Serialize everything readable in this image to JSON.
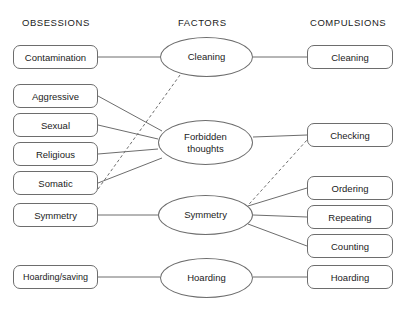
{
  "diagram": {
    "title_present": false,
    "background_color": "#ffffff",
    "stroke_color": "#6d6d6d",
    "text_color": "#1b1b1b",
    "columns": [
      {
        "id": "obsessions",
        "label": "OBSESSIONS"
      },
      {
        "id": "factors",
        "label": "FACTORS"
      },
      {
        "id": "compulsions",
        "label": "COMPULSIONS"
      }
    ],
    "obsessions": [
      {
        "id": "contamination",
        "label": "Contamination",
        "x": 13,
        "y": 45,
        "w": 85,
        "h": 24
      },
      {
        "id": "aggressive",
        "label": "Aggressive",
        "x": 13,
        "y": 84,
        "w": 85,
        "h": 24
      },
      {
        "id": "sexual",
        "label": "Sexual",
        "x": 13,
        "y": 113,
        "w": 85,
        "h": 24
      },
      {
        "id": "religious",
        "label": "Religious",
        "x": 13,
        "y": 142,
        "w": 85,
        "h": 24
      },
      {
        "id": "somatic",
        "label": "Somatic",
        "x": 13,
        "y": 171,
        "w": 85,
        "h": 24
      },
      {
        "id": "symmetry-obs",
        "label": "Symmetry",
        "x": 13,
        "y": 203,
        "w": 85,
        "h": 24
      },
      {
        "id": "hoarding-saving",
        "label": "Hoarding/saving",
        "x": 13,
        "y": 265,
        "w": 85,
        "h": 24
      }
    ],
    "factors": [
      {
        "id": "cleaning-factor",
        "label": "Cleaning",
        "lines": [
          "Cleaning"
        ],
        "x": 160,
        "y": 37,
        "w": 93,
        "h": 40
      },
      {
        "id": "forbidden-thoughts-factor",
        "label": "Forbidden thoughts",
        "lines": [
          "Forbidden",
          "thoughts"
        ],
        "x": 158,
        "y": 120,
        "w": 95,
        "h": 45
      },
      {
        "id": "symmetry-factor",
        "label": "Symmetry",
        "lines": [
          "Symmetry"
        ],
        "x": 158,
        "y": 195,
        "w": 95,
        "h": 40
      },
      {
        "id": "hoarding-factor",
        "label": "Hoarding",
        "lines": [
          "Hoarding"
        ],
        "x": 160,
        "y": 258,
        "w": 93,
        "h": 40
      }
    ],
    "compulsions": [
      {
        "id": "cleaning-comp",
        "label": "Cleaning",
        "x": 307,
        "y": 45,
        "w": 86,
        "h": 24
      },
      {
        "id": "checking",
        "label": "Checking",
        "x": 307,
        "y": 123,
        "w": 86,
        "h": 24
      },
      {
        "id": "ordering",
        "label": "Ordering",
        "x": 307,
        "y": 176,
        "w": 86,
        "h": 24
      },
      {
        "id": "repeating",
        "label": "Repeating",
        "x": 307,
        "y": 205,
        "w": 86,
        "h": 24
      },
      {
        "id": "counting",
        "label": "Counting",
        "x": 307,
        "y": 234,
        "w": 86,
        "h": 24
      },
      {
        "id": "hoarding-comp",
        "label": "Hoarding",
        "x": 307,
        "y": 265,
        "w": 86,
        "h": 24
      }
    ],
    "edges": [
      {
        "from": "contamination",
        "to": "cleaning-factor",
        "style": "solid",
        "x1": 98,
        "y1": 57,
        "x2": 160,
        "y2": 57
      },
      {
        "from": "cleaning-factor",
        "to": "cleaning-comp",
        "style": "solid",
        "x1": 253,
        "y1": 57,
        "x2": 307,
        "y2": 57
      },
      {
        "from": "somatic",
        "to": "cleaning-factor",
        "style": "dashed",
        "x1": 98,
        "y1": 189,
        "x2": 180,
        "y2": 75
      },
      {
        "from": "aggressive",
        "to": "forbidden-thoughts-factor",
        "style": "solid",
        "x1": 98,
        "y1": 96,
        "x2": 162,
        "y2": 131
      },
      {
        "from": "sexual",
        "to": "forbidden-thoughts-factor",
        "style": "solid",
        "x1": 98,
        "y1": 125,
        "x2": 158,
        "y2": 139
      },
      {
        "from": "religious",
        "to": "forbidden-thoughts-factor",
        "style": "solid",
        "x1": 98,
        "y1": 154,
        "x2": 158,
        "y2": 149
      },
      {
        "from": "somatic",
        "to": "forbidden-thoughts-factor",
        "style": "solid",
        "x1": 98,
        "y1": 183,
        "x2": 162,
        "y2": 158
      },
      {
        "from": "forbidden-thoughts-factor",
        "to": "checking",
        "style": "solid",
        "x1": 253,
        "y1": 137,
        "x2": 307,
        "y2": 135
      },
      {
        "from": "symmetry-factor",
        "to": "checking",
        "style": "dashed",
        "x1": 242,
        "y1": 212,
        "x2": 307,
        "y2": 140
      },
      {
        "from": "symmetry-obs",
        "to": "symmetry-factor",
        "style": "solid",
        "x1": 98,
        "y1": 215,
        "x2": 158,
        "y2": 215
      },
      {
        "from": "symmetry-factor",
        "to": "ordering",
        "style": "solid",
        "x1": 248,
        "y1": 206,
        "x2": 307,
        "y2": 188
      },
      {
        "from": "symmetry-factor",
        "to": "repeating",
        "style": "solid",
        "x1": 253,
        "y1": 215,
        "x2": 307,
        "y2": 217
      },
      {
        "from": "symmetry-factor",
        "to": "counting",
        "style": "solid",
        "x1": 248,
        "y1": 224,
        "x2": 307,
        "y2": 246
      },
      {
        "from": "hoarding-saving",
        "to": "hoarding-factor",
        "style": "solid",
        "x1": 98,
        "y1": 277,
        "x2": 160,
        "y2": 277
      },
      {
        "from": "hoarding-factor",
        "to": "hoarding-comp",
        "style": "solid",
        "x1": 253,
        "y1": 277,
        "x2": 307,
        "y2": 277
      }
    ],
    "header_positions": [
      {
        "id": "obsessions",
        "x": 22,
        "y": 17
      },
      {
        "id": "factors",
        "x": 178,
        "y": 17
      },
      {
        "id": "compulsions",
        "x": 310,
        "y": 17
      }
    ]
  }
}
